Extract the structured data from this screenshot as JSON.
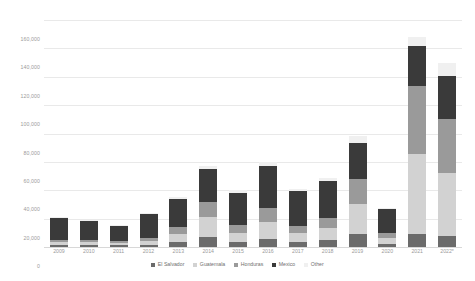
{
  "chart_data": {
    "type": "bar",
    "stacked": true,
    "title": "",
    "subtitle": "",
    "xlabel": "",
    "ylabel": "",
    "categories": [
      "2009",
      "2010",
      "2011",
      "2012",
      "2013",
      "2014",
      "2015",
      "2016",
      "2017",
      "2018",
      "2019",
      "2020",
      "2021",
      "2022*"
    ],
    "ylim": [
      0,
      160000
    ],
    "yticks": [
      0,
      20000,
      40000,
      60000,
      80000,
      100000,
      120000,
      140000,
      160000
    ],
    "ytick_labels": [
      "0",
      "20,000",
      "40,000",
      "60,000",
      "80,000",
      "100,000",
      "120,000",
      "140,000",
      "160,000"
    ],
    "grid": true,
    "legend_position": "bottom",
    "series": [
      {
        "name": "El Salvador",
        "color": "#6b6b6b",
        "values": [
          1200,
          1300,
          1100,
          1500,
          3200,
          7000,
          3500,
          6000,
          3200,
          4700,
          9000,
          2000,
          9500,
          7500
        ]
      },
      {
        "name": "Guatemala",
        "color": "#d2d2d2",
        "values": [
          2000,
          2100,
          1700,
          2800,
          6000,
          14000,
          6500,
          11500,
          6500,
          9000,
          21000,
          4500,
          56000,
          45000
        ]
      },
      {
        "name": "Honduras",
        "color": "#9a9a9a",
        "values": [
          1500,
          1600,
          1300,
          2200,
          4800,
          11000,
          5200,
          10000,
          5000,
          7000,
          18000,
          3500,
          48000,
          38000
        ]
      },
      {
        "name": "Mexico",
        "color": "#3a3a3a",
        "values": [
          15500,
          13500,
          11000,
          16500,
          20000,
          23000,
          23000,
          29500,
          24500,
          25500,
          25000,
          16500,
          28000,
          30000
        ]
      },
      {
        "name": "Other",
        "color": "#f0f0f0",
        "values": [
          800,
          800,
          700,
          1000,
          1500,
          2000,
          1800,
          3000,
          1800,
          2300,
          5500,
          1000,
          6500,
          9500
        ]
      }
    ],
    "totals": [
      21000,
      19300,
      15800,
      24000,
      35500,
      57000,
      40000,
      60000,
      41000,
      48500,
      78500,
      27500,
      148000,
      130000
    ]
  },
  "legend": {
    "items": [
      {
        "label": "El Salvador"
      },
      {
        "label": "Guatemala"
      },
      {
        "label": "Honduras"
      },
      {
        "label": "Mexico"
      },
      {
        "label": "Other"
      }
    ]
  }
}
